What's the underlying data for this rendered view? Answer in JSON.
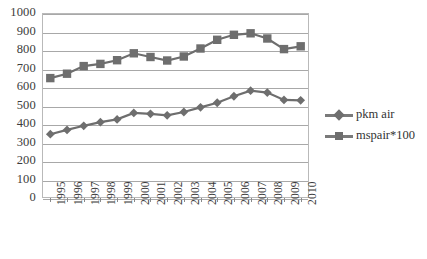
{
  "chart_data": {
    "type": "line",
    "title": "",
    "xlabel": "",
    "ylabel": "",
    "ylim": [
      0,
      1000
    ],
    "ytick_step": 100,
    "grid": true,
    "legend_position": "right",
    "categories": [
      "1995",
      "1996",
      "1997",
      "1998",
      "1999",
      "2000",
      "2001",
      "2002",
      "2003",
      "2004",
      "2005",
      "2006",
      "2007",
      "2008",
      "2009",
      "2010"
    ],
    "series": [
      {
        "name": "pkm air",
        "marker": "diamond",
        "color": "#6e6e6e",
        "values": [
          345,
          368,
          390,
          410,
          425,
          460,
          455,
          447,
          465,
          490,
          515,
          550,
          580,
          570,
          530,
          528
        ]
      },
      {
        "name": "mspair*100",
        "marker": "square",
        "color": "#6e6e6e",
        "values": [
          648,
          672,
          713,
          725,
          745,
          782,
          762,
          743,
          765,
          808,
          855,
          882,
          890,
          862,
          805,
          820
        ]
      }
    ],
    "ytick_labels": [
      "1000",
      "900",
      "800",
      "700",
      "600",
      "500",
      "400",
      "300",
      "200",
      "100",
      "0"
    ],
    "legend": [
      {
        "label": "pkm air",
        "marker": "diamond"
      },
      {
        "label": "mspair*100",
        "marker": "square"
      }
    ]
  },
  "legend": {
    "series1_label": "pkm air",
    "series2_label": "mspair*100"
  }
}
